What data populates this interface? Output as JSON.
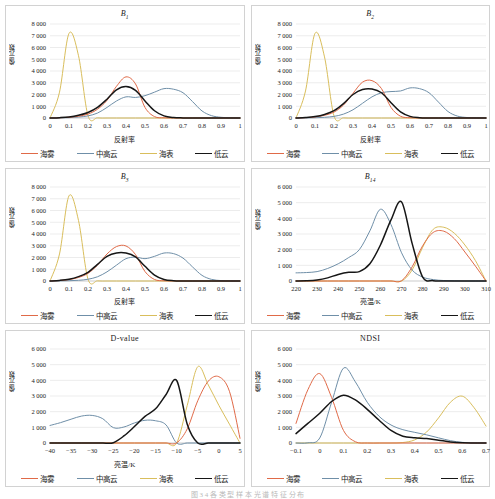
{
  "figure": {
    "caption": "图 3 4 各 类 型 样 本 光 谱 特 征 分 布",
    "series_names": [
      "海雾",
      "中高云",
      "海表",
      "低云"
    ],
    "colors": {
      "haiwu": "#e06a48",
      "zhonggaoyun": "#6f8fa8",
      "haibiao": "#d9be5c",
      "diyun": "#161616"
    },
    "ylabel_reflect": "像元数",
    "xlabel_reflect": "反射率",
    "xlabel_bt": "亮温/K"
  },
  "panels": [
    {
      "id": "B1",
      "title_main": "B",
      "title_sub": "1",
      "title_italic": true,
      "xlabel": "反射率",
      "ylabel": "像元数",
      "yticks": [
        "0",
        "1 000",
        "2 000",
        "3 000",
        "4 000",
        "5 000",
        "6 000",
        "7 000",
        "8 000"
      ],
      "xticks": [
        "0",
        "0.1",
        "0.2",
        "0.3",
        "0.4",
        "0.5",
        "0.6",
        "0.7",
        "0.8",
        "0.9",
        "1"
      ],
      "legend": [
        "海雾",
        "中高云",
        "海表",
        "低云"
      ]
    },
    {
      "id": "B2",
      "title_main": "B",
      "title_sub": "2",
      "title_italic": true,
      "xlabel": "反射率",
      "ylabel": "像元数",
      "yticks": [
        "0",
        "1 000",
        "2 000",
        "3 000",
        "4 000",
        "5 000",
        "6 000",
        "7 000",
        "8 000"
      ],
      "xticks": [
        "0",
        "0.1",
        "0.2",
        "0.3",
        "0.4",
        "0.5",
        "0.6",
        "0.7",
        "0.8",
        "0.9",
        "1"
      ],
      "legend": [
        "海雾",
        "中高云",
        "海表",
        "低云"
      ]
    },
    {
      "id": "B3",
      "title_main": "B",
      "title_sub": "3",
      "title_italic": true,
      "xlabel": "反射率",
      "ylabel": "像元数",
      "yticks": [
        "0",
        "1 000",
        "2 000",
        "3 000",
        "4 000",
        "5 000",
        "6 000",
        "7 000",
        "8 000"
      ],
      "xticks": [
        "0",
        "0.1",
        "0.2",
        "0.3",
        "0.4",
        "0.5",
        "0.6",
        "0.7",
        "0.8",
        "0.9",
        "1"
      ],
      "legend": [
        "海雾",
        "中高云",
        "海表",
        "低云"
      ]
    },
    {
      "id": "B14",
      "title_main": "B",
      "title_sub": "14",
      "title_italic": true,
      "xlabel": "亮温/K",
      "ylabel": "像元数",
      "yticks": [
        "0",
        "1 000",
        "2 000",
        "3 000",
        "4 000",
        "5 000",
        "6 000"
      ],
      "xticks": [
        "220",
        "230",
        "240",
        "250",
        "260",
        "270",
        "280",
        "290",
        "300",
        "310"
      ],
      "legend": [
        "海雾",
        "中高云",
        "海表",
        "低云"
      ]
    },
    {
      "id": "Dvalue",
      "title_main": "D-value",
      "title_sub": "",
      "title_italic": false,
      "xlabel": "亮温/K",
      "ylabel": "像元数",
      "yticks": [
        "0",
        "1 000",
        "2 000",
        "3 000",
        "4 000",
        "5 000",
        "6 000"
      ],
      "xticks": [
        "−40",
        "−35",
        "−30",
        "−25",
        "−20",
        "−15",
        "−10",
        "−5",
        "0",
        "5"
      ],
      "legend": [
        "海雾",
        "中高云",
        "海表",
        "低云"
      ]
    },
    {
      "id": "NDSI",
      "title_main": "NDSI",
      "title_sub": "",
      "title_italic": false,
      "xlabel": "",
      "ylabel": "像元数",
      "yticks": [
        "0",
        "1 000",
        "2 000",
        "3 000",
        "4 000",
        "5 000",
        "6 000"
      ],
      "xticks": [
        "−0.1",
        "0",
        "0.1",
        "0.2",
        "0.3",
        "0.4",
        "0.5",
        "0.6",
        "0.7"
      ],
      "legend": [
        "海雾",
        "中高云",
        "海表",
        "低云"
      ]
    }
  ],
  "chart_data": [
    {
      "type": "line",
      "title": "B1",
      "xlabel": "反射率",
      "ylabel": "像元数",
      "xlim": [
        0,
        1
      ],
      "ylim": [
        0,
        8000
      ],
      "grid": true,
      "legend_position": "bottom",
      "x": [
        0,
        0.05,
        0.1,
        0.15,
        0.2,
        0.25,
        0.3,
        0.35,
        0.4,
        0.45,
        0.5,
        0.55,
        0.6,
        0.65,
        0.7,
        0.75,
        0.8,
        0.85,
        0.9,
        0.95,
        1.0
      ],
      "series": [
        {
          "name": "海雾",
          "values": [
            0,
            20,
            60,
            150,
            330,
            750,
            1500,
            2700,
            3500,
            2900,
            900,
            120,
            20,
            5,
            0,
            0,
            0,
            0,
            0,
            0,
            0
          ]
        },
        {
          "name": "中高云",
          "values": [
            0,
            10,
            30,
            80,
            180,
            420,
            900,
            1450,
            1800,
            1750,
            1900,
            2200,
            2500,
            2450,
            2150,
            1400,
            600,
            200,
            60,
            15,
            0
          ]
        },
        {
          "name": "海表",
          "values": [
            0,
            2200,
            7200,
            5300,
            200,
            10,
            0,
            0,
            0,
            0,
            0,
            0,
            0,
            0,
            0,
            0,
            0,
            0,
            0,
            0,
            0
          ]
        },
        {
          "name": "低云",
          "values": [
            0,
            30,
            90,
            230,
            470,
            900,
            1600,
            2400,
            2680,
            2350,
            1450,
            620,
            180,
            40,
            10,
            0,
            0,
            0,
            0,
            0,
            0
          ]
        }
      ]
    },
    {
      "type": "line",
      "title": "B2",
      "xlabel": "反射率",
      "ylabel": "像元数",
      "xlim": [
        0,
        1
      ],
      "ylim": [
        0,
        8000
      ],
      "grid": true,
      "legend_position": "bottom",
      "x": [
        0,
        0.05,
        0.1,
        0.15,
        0.2,
        0.25,
        0.3,
        0.35,
        0.4,
        0.45,
        0.5,
        0.55,
        0.6,
        0.65,
        0.7,
        0.75,
        0.8,
        0.85,
        0.9,
        0.95,
        1.0
      ],
      "series": [
        {
          "name": "海雾",
          "values": [
            0,
            30,
            90,
            230,
            500,
            1100,
            2100,
            3050,
            3180,
            2500,
            900,
            150,
            25,
            5,
            0,
            0,
            0,
            0,
            0,
            0,
            0
          ]
        },
        {
          "name": "中高云",
          "values": [
            0,
            10,
            25,
            60,
            140,
            330,
            700,
            1250,
            1800,
            2150,
            2250,
            2300,
            2560,
            2500,
            2150,
            1350,
            550,
            160,
            40,
            10,
            0
          ]
        },
        {
          "name": "海表",
          "values": [
            0,
            2300,
            7200,
            5200,
            180,
            10,
            0,
            0,
            0,
            0,
            0,
            0,
            0,
            0,
            0,
            0,
            0,
            0,
            0,
            0,
            0
          ]
        },
        {
          "name": "低云",
          "values": [
            0,
            40,
            120,
            300,
            620,
            1220,
            2000,
            2430,
            2470,
            2150,
            1300,
            520,
            140,
            30,
            5,
            0,
            0,
            0,
            0,
            0,
            0
          ]
        }
      ]
    },
    {
      "type": "line",
      "title": "B3",
      "xlabel": "反射率",
      "ylabel": "像元数",
      "xlim": [
        0,
        1
      ],
      "ylim": [
        0,
        8000
      ],
      "grid": true,
      "legend_position": "bottom",
      "x": [
        0,
        0.05,
        0.1,
        0.15,
        0.2,
        0.25,
        0.3,
        0.35,
        0.4,
        0.45,
        0.5,
        0.55,
        0.6,
        0.65,
        0.7,
        0.75,
        0.8,
        0.85,
        0.9,
        0.95,
        1.0
      ],
      "series": [
        {
          "name": "海雾",
          "values": [
            0,
            40,
            120,
            300,
            650,
            1350,
            2300,
            2930,
            2980,
            2250,
            800,
            130,
            20,
            5,
            0,
            0,
            0,
            0,
            0,
            0,
            0
          ]
        },
        {
          "name": "中高云",
          "values": [
            0,
            10,
            25,
            60,
            150,
            360,
            780,
            1350,
            1900,
            2030,
            1900,
            2100,
            2380,
            2330,
            1950,
            1200,
            480,
            140,
            35,
            8,
            0
          ]
        },
        {
          "name": "海表",
          "values": [
            0,
            2300,
            7250,
            5150,
            160,
            10,
            0,
            0,
            0,
            0,
            0,
            0,
            0,
            0,
            0,
            0,
            0,
            0,
            0,
            0,
            0
          ]
        },
        {
          "name": "低云",
          "values": [
            0,
            50,
            150,
            370,
            740,
            1420,
            2100,
            2390,
            2380,
            2050,
            1250,
            500,
            130,
            25,
            5,
            0,
            0,
            0,
            0,
            0,
            0
          ]
        }
      ]
    },
    {
      "type": "line",
      "title": "B14",
      "xlabel": "亮温/K",
      "ylabel": "像元数",
      "xlim": [
        220,
        310
      ],
      "ylim": [
        0,
        6000
      ],
      "grid": true,
      "legend_position": "bottom",
      "x": [
        220,
        225,
        230,
        235,
        240,
        245,
        250,
        255,
        260,
        265,
        270,
        275,
        280,
        285,
        290,
        295,
        300,
        305,
        310
      ],
      "series": [
        {
          "name": "海雾",
          "values": [
            0,
            0,
            0,
            0,
            0,
            0,
            0,
            0,
            0,
            0,
            20,
            900,
            2250,
            3100,
            3180,
            2700,
            1850,
            950,
            0
          ]
        },
        {
          "name": "中高云",
          "values": [
            520,
            540,
            600,
            800,
            1100,
            1500,
            2000,
            3200,
            4580,
            3600,
            1800,
            700,
            250,
            90,
            30,
            10,
            0,
            0,
            0
          ]
        },
        {
          "name": "海表",
          "values": [
            0,
            0,
            0,
            0,
            0,
            0,
            0,
            0,
            0,
            0,
            0,
            700,
            2150,
            3300,
            3430,
            3050,
            2300,
            1300,
            0
          ]
        },
        {
          "name": "低云",
          "values": [
            0,
            10,
            60,
            200,
            420,
            560,
            600,
            1100,
            2300,
            3900,
            5050,
            2400,
            250,
            20,
            0,
            0,
            0,
            0,
            0
          ]
        }
      ]
    },
    {
      "type": "line",
      "title": "D-value",
      "xlabel": "亮温/K",
      "ylabel": "像元数",
      "xlim": [
        -40,
        5
      ],
      "ylim": [
        0,
        6000
      ],
      "grid": true,
      "legend_position": "bottom",
      "x": [
        -40,
        -37.5,
        -35,
        -32.5,
        -30,
        -27.5,
        -25,
        -22.5,
        -20,
        -17.5,
        -15,
        -12.5,
        -10,
        -7.5,
        -5,
        -2.5,
        0,
        2.5,
        5
      ],
      "series": [
        {
          "name": "海雾",
          "values": [
            0,
            0,
            0,
            0,
            0,
            0,
            0,
            0,
            0,
            0,
            0,
            0,
            10,
            900,
            2700,
            3950,
            4230,
            3300,
            300
          ]
        },
        {
          "name": "中高云",
          "values": [
            1120,
            1300,
            1520,
            1720,
            1760,
            1550,
            980,
            1020,
            1280,
            1450,
            1420,
            1150,
            0,
            0,
            0,
            0,
            0,
            0,
            0
          ]
        },
        {
          "name": "海表",
          "values": [
            0,
            0,
            0,
            0,
            0,
            0,
            0,
            0,
            0,
            0,
            0,
            0,
            0,
            2400,
            4870,
            3700,
            2400,
            1200,
            0
          ]
        },
        {
          "name": "低云",
          "values": [
            0,
            0,
            0,
            0,
            0,
            0,
            20,
            450,
            1050,
            1700,
            2180,
            3100,
            3990,
            1200,
            0,
            0,
            0,
            0,
            0
          ]
        }
      ]
    },
    {
      "type": "line",
      "title": "NDSI",
      "xlabel": "",
      "ylabel": "像元数",
      "xlim": [
        -0.1,
        0.7
      ],
      "ylim": [
        0,
        6000
      ],
      "grid": true,
      "legend_position": "bottom",
      "x": [
        -0.1,
        -0.05,
        0,
        0.05,
        0.1,
        0.15,
        0.2,
        0.25,
        0.3,
        0.35,
        0.4,
        0.45,
        0.5,
        0.55,
        0.6,
        0.65,
        0.7
      ],
      "series": [
        {
          "name": "海雾",
          "values": [
            1250,
            3400,
            4430,
            2900,
            800,
            80,
            0,
            0,
            0,
            0,
            0,
            0,
            0,
            0,
            0,
            0,
            0
          ]
        },
        {
          "name": "中高云",
          "values": [
            0,
            10,
            320,
            2600,
            4780,
            3900,
            2600,
            1700,
            1150,
            850,
            680,
            520,
            330,
            150,
            40,
            10,
            0
          ]
        },
        {
          "name": "海表",
          "values": [
            0,
            0,
            0,
            0,
            0,
            0,
            0,
            0,
            0,
            30,
            200,
            700,
            1600,
            2600,
            2990,
            2250,
            1080
          ]
        },
        {
          "name": "低云",
          "values": [
            600,
            1250,
            1900,
            2650,
            3050,
            2750,
            2150,
            1450,
            800,
            430,
            330,
            280,
            180,
            70,
            10,
            0,
            0
          ]
        }
      ]
    }
  ]
}
